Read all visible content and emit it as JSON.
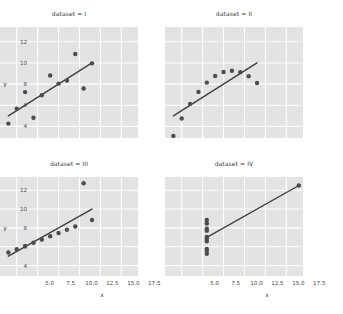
{
  "figure": {
    "background_color": "#ffffff",
    "panel_color": "#e3e3e3",
    "grid_color": "#ffffff",
    "marker_color": "#4c4c4c",
    "line_color": "#3f3f3f",
    "tick_label_color": "#4a4a4a"
  },
  "axes": {
    "xlabel": "x",
    "ylabel": "y",
    "xticks": [
      "5.0",
      "7.5",
      "10.0",
      "12.5",
      "15.0",
      "17.5"
    ],
    "xtick_values": [
      5.0,
      7.5,
      10.0,
      12.5,
      15.0,
      17.5
    ],
    "yticks": [
      "4",
      "6",
      "8",
      "10",
      "12"
    ],
    "ytick_values": [
      4,
      6,
      8,
      10,
      12
    ],
    "xlim": [
      3.0,
      19.5
    ],
    "ylim": [
      2.9,
      13.4
    ]
  },
  "chart_data": {
    "type": "scatter",
    "xlabel": "x",
    "ylabel": "y",
    "xlim": [
      3.0,
      19.5
    ],
    "ylim": [
      2.9,
      13.4
    ],
    "grid": true,
    "legend": "none",
    "layout": "2x2 facet grid",
    "facet_variable": "dataset",
    "panels": [
      {
        "title": "dataset = I",
        "dataset": "I",
        "row": 0,
        "col": 0,
        "x": [
          10.0,
          8.0,
          13.0,
          9.0,
          11.0,
          14.0,
          6.0,
          4.0,
          12.0,
          7.0,
          5.0
        ],
        "y": [
          8.04,
          6.95,
          7.58,
          8.81,
          8.33,
          9.96,
          7.24,
          4.26,
          10.84,
          4.82,
          5.68
        ],
        "fit": {
          "slope": 0.5001,
          "intercept": 3.0001,
          "x_start": 4.0,
          "x_end": 14.0
        }
      },
      {
        "title": "dataset = II",
        "dataset": "II",
        "row": 0,
        "col": 1,
        "x": [
          10.0,
          8.0,
          13.0,
          9.0,
          11.0,
          14.0,
          6.0,
          4.0,
          12.0,
          7.0,
          5.0
        ],
        "y": [
          9.14,
          8.14,
          8.74,
          8.77,
          9.26,
          8.1,
          6.13,
          3.1,
          9.13,
          7.26,
          4.74
        ],
        "fit": {
          "slope": 0.5,
          "intercept": 3.001,
          "x_start": 4.0,
          "x_end": 14.0
        }
      },
      {
        "title": "dataset = III",
        "dataset": "III",
        "row": 1,
        "col": 0,
        "x": [
          10.0,
          8.0,
          13.0,
          9.0,
          11.0,
          14.0,
          6.0,
          4.0,
          12.0,
          7.0,
          5.0
        ],
        "y": [
          7.46,
          6.77,
          12.74,
          7.11,
          7.81,
          8.84,
          6.08,
          5.39,
          8.15,
          6.42,
          5.73
        ],
        "fit": {
          "slope": 0.4997,
          "intercept": 3.0025,
          "x_start": 4.0,
          "x_end": 14.0
        }
      },
      {
        "title": "dataset = IV",
        "dataset": "IV",
        "row": 1,
        "col": 1,
        "x": [
          8.0,
          8.0,
          8.0,
          8.0,
          8.0,
          8.0,
          8.0,
          19.0,
          8.0,
          8.0,
          8.0
        ],
        "y": [
          6.58,
          5.76,
          7.71,
          8.84,
          8.47,
          7.04,
          5.25,
          12.5,
          5.56,
          7.91,
          6.89
        ],
        "fit": {
          "slope": 0.4999,
          "intercept": 3.0017,
          "x_start": 8.0,
          "x_end": 19.0
        }
      }
    ]
  }
}
